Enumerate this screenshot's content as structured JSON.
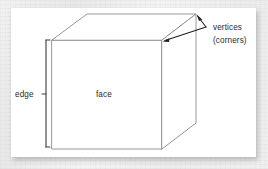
{
  "figure": {
    "panel": {
      "background_color": "#ffffff",
      "backdrop_color": "#eeeeee"
    },
    "line_color": "#8c8c8c",
    "annotation_color": "#2b2b2b",
    "labels": {
      "edge": "edge",
      "face": "face",
      "vertices": "vertices",
      "corners": "(corners)"
    },
    "shape": {
      "name": "cube",
      "front_face": {
        "top_left": [
          52,
          40
        ],
        "top_right": [
          162,
          40
        ],
        "bottom_right": [
          162,
          149
        ],
        "bottom_left": [
          52,
          149
        ]
      },
      "top_back_left": [
        87,
        14
      ],
      "top_back_right": [
        196,
        14
      ],
      "right_back_bottom": [
        196,
        123
      ]
    },
    "callouts": [
      {
        "name": "vertices-callout",
        "label": "vertices",
        "origin": [
          205,
          27
        ],
        "targets": [
          [
            197,
            16
          ],
          [
            164,
            41
          ]
        ]
      },
      {
        "name": "edge-bracket",
        "label": "edge",
        "x": 46,
        "y_top": 40,
        "y_bottom": 147,
        "tick_y": 94
      }
    ]
  }
}
